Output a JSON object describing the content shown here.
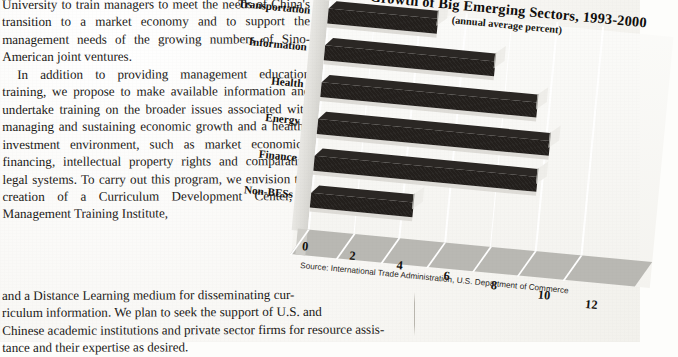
{
  "document": {
    "body_column": [
      "University to train managers to meet the needs of China's transition to a market economy and to support the management needs of the growing numbers of Sino-American joint ventures.",
      "In addition to providing management education training, we propose to make available information and undertake training on the broader issues associated with managing and sustaining economic growth and a healthy investment environment, such as market economics, financing, intellectual property rights and comparative legal systems.  To carry out this program, we envision the creation of a Curriculum Development Center, a Management Training Institute,"
    ],
    "body_wide": [
      "and a Distance Learning medium for disseminating cur-",
      "riculum information.  We plan to seek the support of U.S. and",
      "Chinese academic institutions and private sector firms for resource assis-",
      "tance and their expertise as desired."
    ]
  },
  "chart_data": {
    "type": "bar",
    "orientation": "horizontal",
    "title": "Growth of Big Emerging Sectors, 1993-2000",
    "subtitle": "(annual average percent)",
    "source": "Source: International Trade Administration, U.S. Department of Commerce",
    "xlabel": "",
    "ylabel": "",
    "xlim": [
      0,
      12
    ],
    "xticks": [
      "0",
      "2",
      "4",
      "6",
      "8",
      "10",
      "12"
    ],
    "grid": true,
    "legend": "none",
    "categories": [
      "Transportation",
      "Information",
      "Health",
      "Energy",
      "Finance",
      "Non-BESs"
    ],
    "values": [
      4.8,
      7.5,
      9.5,
      10.2,
      9.8,
      4.5
    ],
    "bar_color": "#231f1c",
    "plot_background": "#f4f3ef"
  }
}
